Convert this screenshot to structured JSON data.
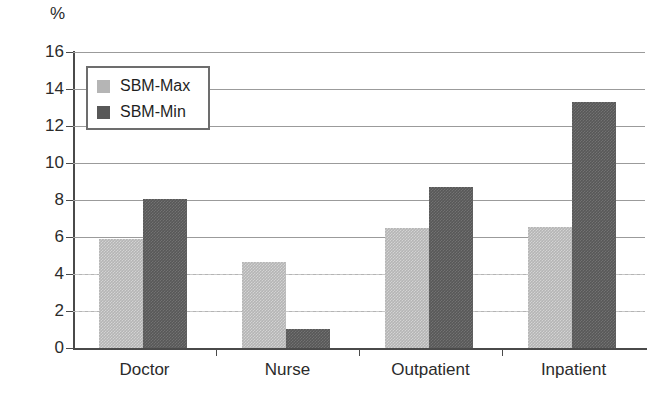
{
  "chart_data": {
    "type": "bar",
    "title": "",
    "subtitle": "",
    "unit_label": "%",
    "xlabel": "",
    "ylabel": "%",
    "ylim": [
      0,
      16
    ],
    "yticks": [
      0,
      2,
      4,
      6,
      8,
      10,
      12,
      14,
      16
    ],
    "grid": true,
    "legend_position": "top-left-inside",
    "categories": [
      "Doctor",
      "Nurse",
      "Outpatient",
      "Inpatient"
    ],
    "series": [
      {
        "name": "SBM-Max",
        "color": "#b5b5b5",
        "values": [
          5.9,
          4.65,
          6.5,
          6.55
        ]
      },
      {
        "name": "SBM-Min",
        "color": "#585858",
        "values": [
          8.05,
          1.05,
          8.7,
          13.3
        ]
      }
    ]
  },
  "legend": {
    "items": [
      {
        "label": "SBM-Max",
        "swatch": "max"
      },
      {
        "label": "SBM-Min",
        "swatch": "min"
      }
    ]
  },
  "colors": {
    "series_max": "#b5b5b5",
    "series_min": "#585858",
    "axis": "#4a4a4a",
    "grid": "#9b9b9b",
    "text": "#2b2b2b",
    "background": "#ffffff"
  }
}
